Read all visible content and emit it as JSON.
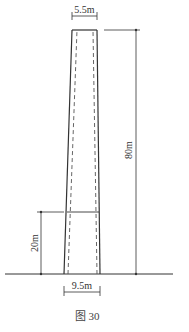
{
  "figure": {
    "caption": "图 30",
    "top_width_label": "5.5m",
    "base_width_label": "9.5m",
    "height_label": "80m",
    "lower_section_label": "20m"
  },
  "structure": {
    "name": "chimney",
    "top_width_m": 5.5,
    "base_width_m": 9.5,
    "height_m": 80,
    "lower_section_height_m": 20
  }
}
